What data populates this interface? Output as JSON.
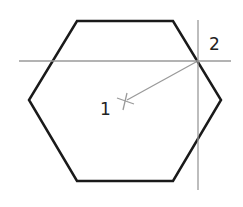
{
  "diagram": {
    "labels": {
      "center": "1",
      "vertex": "2"
    },
    "colors": {
      "outline": "#1a1a1a",
      "construction": "#9a9a9a",
      "label": "#222222"
    }
  }
}
